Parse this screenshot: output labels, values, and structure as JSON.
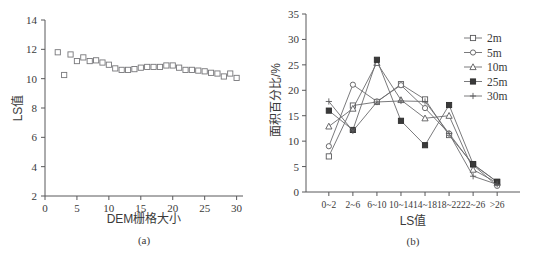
{
  "figure": {
    "panel_a_caption": "(a)",
    "panel_b_caption": "(b)"
  },
  "chart_data": [
    {
      "id": "panel_a",
      "type": "scatter",
      "title": "",
      "xlabel": "DEM栅格大小",
      "ylabel": "LS值",
      "xlim": [
        0,
        31
      ],
      "ylim": [
        2,
        14
      ],
      "xticks": [
        0,
        5,
        10,
        15,
        20,
        25,
        30
      ],
      "yticks": [
        2,
        4,
        6,
        8,
        10,
        12,
        14
      ],
      "grid": false,
      "legend": null,
      "marker": "open-square",
      "x": [
        2,
        3,
        4,
        5,
        6,
        7,
        8,
        9,
        10,
        11,
        12,
        13,
        14,
        15,
        16,
        17,
        18,
        19,
        20,
        21,
        22,
        23,
        24,
        25,
        26,
        27,
        28,
        29,
        30
      ],
      "values": [
        11.8,
        10.25,
        11.65,
        11.2,
        11.45,
        11.2,
        11.25,
        11.1,
        10.95,
        10.7,
        10.6,
        10.6,
        10.65,
        10.75,
        10.8,
        10.8,
        10.8,
        10.9,
        10.9,
        10.75,
        10.6,
        10.6,
        10.55,
        10.5,
        10.4,
        10.35,
        10.15,
        10.35,
        10.05
      ]
    },
    {
      "id": "panel_b",
      "type": "line",
      "title": "",
      "xlabel": "LS值",
      "ylabel": "面积百分比/%",
      "categories": [
        "0~2",
        "2~6",
        "6~10",
        "10~14",
        "14~18",
        "18~22",
        "22~26",
        ">26"
      ],
      "ylim": [
        0,
        35
      ],
      "yticks": [
        0,
        5,
        10,
        15,
        20,
        25,
        30,
        35
      ],
      "grid": false,
      "legend_position": "top-right",
      "series": [
        {
          "name": "2m",
          "marker": "open-square",
          "values": [
            7.0,
            17.0,
            17.7,
            21.2,
            18.2,
            11.2,
            5.4,
            2.0
          ]
        },
        {
          "name": "5m",
          "marker": "open-circle",
          "values": [
            9.0,
            21.1,
            17.8,
            21.0,
            16.5,
            11.5,
            5.3,
            1.2
          ]
        },
        {
          "name": "10m",
          "marker": "open-triangle",
          "values": [
            12.9,
            16.4,
            25.4,
            18.1,
            14.5,
            15.0,
            4.4,
            1.8
          ]
        },
        {
          "name": "25m",
          "marker": "filled-square",
          "values": [
            16.0,
            12.2,
            26.0,
            14.0,
            9.2,
            17.1,
            5.5,
            2.0
          ]
        },
        {
          "name": "30m",
          "marker": "plus",
          "values": [
            17.8,
            12.0,
            17.7,
            17.9,
            17.8,
            11.5,
            3.1,
            1.5
          ]
        }
      ]
    }
  ]
}
